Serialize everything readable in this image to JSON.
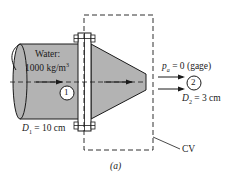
{
  "figure": {
    "caption": "(a)",
    "fluid": {
      "label_line1": "Water:",
      "label_line2_value": "1000 kg/m",
      "label_line2_exp": "3"
    },
    "section1": {
      "id": "1",
      "diameter_symbol": "D",
      "diameter_sub": "1",
      "diameter_value": " = 10 cm"
    },
    "section2": {
      "id": "2",
      "pressure_symbol": "p",
      "pressure_sub": "a",
      "pressure_value": " = 0 (gage)",
      "diameter_symbol": "D",
      "diameter_sub": "2",
      "diameter_value": " = 3 cm"
    },
    "control_volume_label": "CV"
  },
  "colors": {
    "pipe_fill": "#b3b3b3",
    "line": "#1a1a1a",
    "flange_fill": "#ffffff"
  }
}
